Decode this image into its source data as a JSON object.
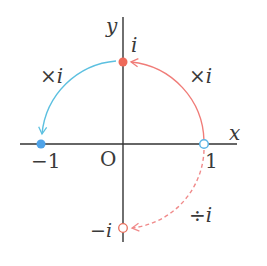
{
  "diagram": {
    "type": "complex-plane-rotation",
    "axes": {
      "x_label": "x",
      "y_label": "y",
      "origin_label": "O"
    },
    "points": [
      {
        "name": "one",
        "label": "1",
        "value": "1",
        "style": "hollow",
        "color": "#5ab4e6"
      },
      {
        "name": "i",
        "label": "i",
        "value": "i",
        "style": "filled",
        "color": "#ee6a5a"
      },
      {
        "name": "minus-one",
        "label": "−1",
        "value": "-1",
        "style": "filled",
        "color": "#4fa3e8"
      },
      {
        "name": "minus-i",
        "label": "−i",
        "value": "-i",
        "style": "hollow",
        "color": "#e8705e"
      }
    ],
    "arrows": [
      {
        "from": "1",
        "to": "i",
        "label": "×i",
        "style": "solid",
        "color": "#f07c78"
      },
      {
        "from": "i",
        "to": "-1",
        "label": "×i",
        "style": "solid",
        "color": "#5cc0e0"
      },
      {
        "from": "1",
        "to": "-i",
        "label": "÷i",
        "style": "dashed",
        "color": "#f08a8a"
      }
    ],
    "colors": {
      "axis": "#333333",
      "text": "#3a3a3a"
    }
  }
}
